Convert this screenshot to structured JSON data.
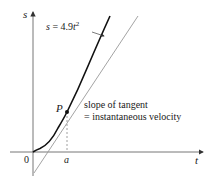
{
  "diagram": {
    "axes": {
      "x_label": "t",
      "y_label": "s",
      "origin_label": "0"
    },
    "curve": {
      "equation_lhs": "s = 4.9",
      "equation_var": "t",
      "equation_exp": "2"
    },
    "point": {
      "label": "P",
      "x_tick_label": "a"
    },
    "annotation": {
      "line1": "slope of tangent",
      "line2": "= instantaneous velocity"
    },
    "colors": {
      "curve": "#111111",
      "tangent": "#888888",
      "axis": "#555555",
      "text": "#1a1a1a"
    }
  }
}
